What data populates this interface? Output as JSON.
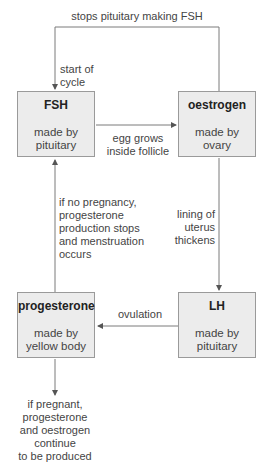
{
  "diagram": {
    "nodes": [
      {
        "id": "fsh",
        "title": "FSH",
        "subtitle": "made by\npituitary",
        "subtitle_lines": [
          "made by",
          "pituitary"
        ]
      },
      {
        "id": "oestrogen",
        "title": "oestrogen",
        "subtitle_lines": [
          "made by",
          "ovary"
        ]
      },
      {
        "id": "lh",
        "title": "LH",
        "subtitle_lines": [
          "made by",
          "pituitary"
        ]
      },
      {
        "id": "progesterone",
        "title": "progesterone",
        "subtitle_lines": [
          "made by",
          "yellow body"
        ]
      }
    ],
    "edges": [
      {
        "from": "oestrogen",
        "to": "fsh",
        "label_lines": [
          "stops pituitary making FSH"
        ]
      },
      {
        "from": "fsh",
        "to": "oestrogen",
        "label_lines": [
          "egg grows",
          "inside follicle"
        ]
      },
      {
        "from": "oestrogen",
        "to": "lh",
        "label_lines": [
          "lining of",
          "uterus",
          "thickens"
        ]
      },
      {
        "from": "lh",
        "to": "progesterone",
        "label_lines": [
          "ovulation"
        ]
      },
      {
        "from": "progesterone",
        "to": "fsh",
        "label_lines": [
          "if no pregnancy,",
          "progesterone",
          "production stops",
          "and menstruation",
          "occurs"
        ]
      },
      {
        "from": "progesterone",
        "to": "outcome",
        "label_lines": [
          "if pregnant,",
          "progesterone",
          "and oestrogen",
          "continue",
          "to be produced"
        ]
      }
    ],
    "start_label_lines": [
      "start of",
      "cycle"
    ]
  },
  "colors": {
    "box_fill": "#ececec",
    "box_border": "#9a9a9a",
    "line": "#6a6a6a",
    "text": "#444444"
  }
}
